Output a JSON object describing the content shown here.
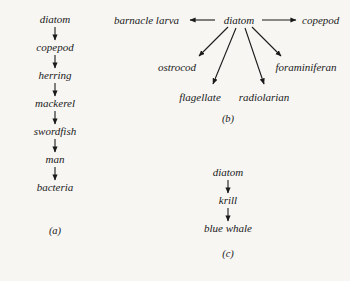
{
  "figure": {
    "background_color": "#f7f6f3",
    "text_color": "#1a1a1a",
    "panels": [
      {
        "id": "a",
        "caption": "(a)",
        "type": "linear-chain",
        "nodes": [
          "diatom",
          "copepod",
          "herring",
          "mackerel",
          "swordfish",
          "man",
          "bacteria"
        ],
        "edges": [
          {
            "from": "diatom",
            "to": "copepod"
          },
          {
            "from": "copepod",
            "to": "herring"
          },
          {
            "from": "herring",
            "to": "mackerel"
          },
          {
            "from": "mackerel",
            "to": "swordfish"
          },
          {
            "from": "swordfish",
            "to": "man"
          },
          {
            "from": "man",
            "to": "bacteria"
          }
        ]
      },
      {
        "id": "b",
        "caption": "(b)",
        "type": "radial-fan",
        "root": "diatom",
        "nodes": [
          "barnacle larva",
          "diatom",
          "copepod",
          "ostrocod",
          "flagellate",
          "radiolarian",
          "foraminiferan"
        ],
        "edges": [
          {
            "from": "diatom",
            "to": "barnacle larva"
          },
          {
            "from": "diatom",
            "to": "copepod"
          },
          {
            "from": "diatom",
            "to": "ostrocod"
          },
          {
            "from": "diatom",
            "to": "flagellate"
          },
          {
            "from": "diatom",
            "to": "radiolarian"
          },
          {
            "from": "diatom",
            "to": "foraminiferan"
          }
        ]
      },
      {
        "id": "c",
        "caption": "(c)",
        "type": "linear-chain",
        "nodes": [
          "diatom",
          "krill",
          "blue whale"
        ],
        "edges": [
          {
            "from": "diatom",
            "to": "krill"
          },
          {
            "from": "krill",
            "to": "blue whale"
          }
        ]
      }
    ]
  },
  "panel_a": {
    "node_0": "diatom",
    "node_1": "copepod",
    "node_2": "herring",
    "node_3": "mackerel",
    "node_4": "swordfish",
    "node_5": "man",
    "node_6": "bacteria",
    "caption": "(a)"
  },
  "panel_b": {
    "node_barnacle": "barnacle larva",
    "node_diatom": "diatom",
    "node_copepod": "copepod",
    "node_ostrocod": "ostrocod",
    "node_flagellate": "flagellate",
    "node_radiolarian": "radiolarian",
    "node_foraminiferan": "foraminiferan",
    "caption": "(b)"
  },
  "panel_c": {
    "node_diatom": "diatom",
    "node_krill": "krill",
    "node_blue_whale": "blue whale",
    "caption": "(c)"
  }
}
